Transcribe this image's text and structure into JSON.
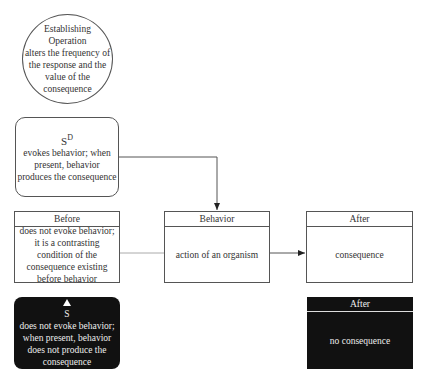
{
  "establishing_operation": {
    "title_line1": "Establishing",
    "title_line2": "Operation",
    "description": "alters the frequency of the response and the value of the consequence"
  },
  "sd": {
    "symbol": "S",
    "superscript": "D",
    "description": "evokes behavior; when present, behavior produces the consequence"
  },
  "before": {
    "header": "Before",
    "body": "does not evoke behavior; it is a contrasting condition of the consequence existing before behavior"
  },
  "behavior": {
    "header": "Behavior",
    "body": "action of an organism"
  },
  "after": {
    "header": "After",
    "body": "consequence"
  },
  "s_delta": {
    "symbol": "S",
    "description": "does not evoke behavior; when present, behavior does not produce the consequence"
  },
  "after_no_consequence": {
    "header": "After",
    "body": "no consequence"
  },
  "colors": {
    "line": "#555555",
    "dark_fill": "#111111",
    "light_text": "#eeeeee"
  }
}
